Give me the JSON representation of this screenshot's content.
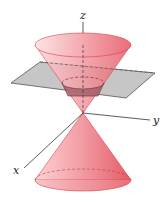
{
  "diagram": {
    "axes": {
      "x_label": "x",
      "y_label": "y",
      "z_label": "z"
    },
    "colors": {
      "cone_fill": "#f08a92",
      "cone_light": "#fbd3d6",
      "cone_dark": "#e05a66",
      "cone_edge": "#d9404e",
      "plane_fill": "#c4c4c4",
      "plane_edge": "#555555",
      "axis": "#333333"
    }
  }
}
